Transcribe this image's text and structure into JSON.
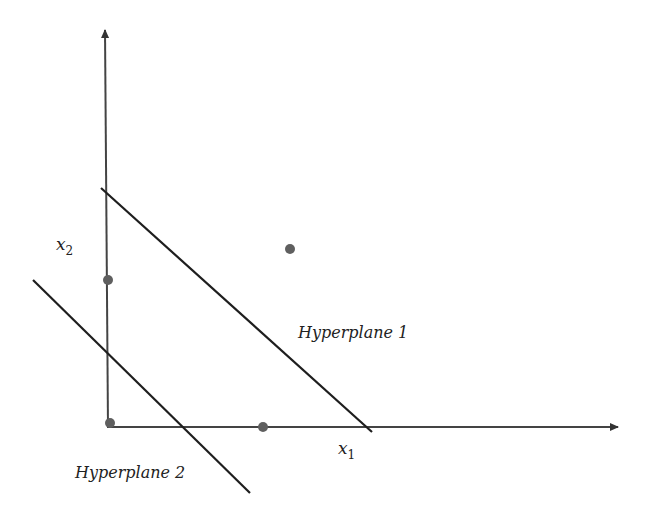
{
  "diagram": {
    "colors": {
      "axis": "#444444",
      "line": "#1e1e1e",
      "point": "#5f5f5f",
      "text": "#222222",
      "background": "#ffffff"
    },
    "axes": {
      "x": {
        "label": "x",
        "subscript": "1"
      },
      "y": {
        "label": "x",
        "subscript": "2"
      }
    },
    "hyperplanes": [
      {
        "label": "Hyperplane 1"
      },
      {
        "label": "Hyperplane 2"
      }
    ],
    "points": [
      {
        "name": "point-a",
        "position": "interior upper right"
      },
      {
        "name": "point-b",
        "position": "on x2 axis"
      },
      {
        "name": "point-c",
        "position": "origin"
      },
      {
        "name": "point-d",
        "position": "on x1 axis"
      }
    ]
  }
}
